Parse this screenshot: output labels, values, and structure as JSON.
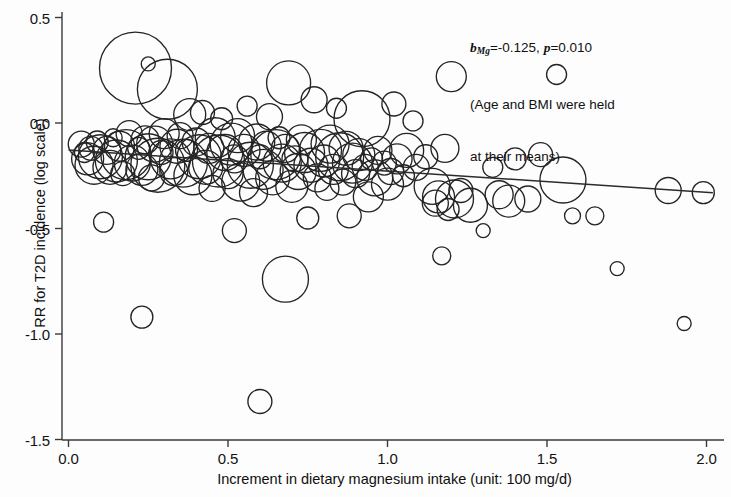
{
  "chart_data": {
    "type": "scatter",
    "title": "",
    "xlabel": "Increment in dietary magnesium intake (unit: 100 mg/d)",
    "ylabel": "RR for T2D incidence (log scale)",
    "xlim": [
      0.0,
      2.05
    ],
    "ylim": [
      -1.55,
      0.55
    ],
    "xticks": [
      "0.0",
      "0.5",
      "1.0",
      "1.5",
      "2.0"
    ],
    "xtick_values": [
      0.0,
      0.5,
      1.0,
      1.5,
      2.0
    ],
    "yticks": [
      "0.5",
      "0.0",
      "-0.5",
      "-1.0",
      "-1.5"
    ],
    "ytick_values": [
      0.5,
      0.0,
      -0.5,
      -1.0,
      -1.5
    ],
    "grid": false,
    "legend": "none",
    "marker_style": "open-circle-variable-size",
    "annotations": {
      "line1_prefix": "b",
      "line1_subscript": "Mg",
      "line1_mid": "=-0.125, ",
      "line1_p": "p",
      "line1_suffix": "=0.010",
      "line2": "(Age and BMI were held",
      "line3": "at their means)",
      "slope": -0.125,
      "p_value": 0.01
    },
    "regression_line": {
      "x_start": 0.0,
      "y_start": -0.128,
      "x_end": 2.02,
      "y_end": -0.33,
      "color": "#2b2b2b"
    },
    "points": [
      {
        "x": 0.04,
        "y": -0.1,
        "s": 13
      },
      {
        "x": 0.05,
        "y": -0.14,
        "s": 10
      },
      {
        "x": 0.06,
        "y": -0.17,
        "s": 16
      },
      {
        "x": 0.07,
        "y": -0.12,
        "s": 12
      },
      {
        "x": 0.08,
        "y": -0.2,
        "s": 19
      },
      {
        "x": 0.09,
        "y": -0.09,
        "s": 11
      },
      {
        "x": 0.1,
        "y": -0.16,
        "s": 22
      },
      {
        "x": 0.11,
        "y": -0.47,
        "s": 10
      },
      {
        "x": 0.12,
        "y": -0.13,
        "s": 14
      },
      {
        "x": 0.13,
        "y": -0.21,
        "s": 17
      },
      {
        "x": 0.14,
        "y": -0.07,
        "s": 9
      },
      {
        "x": 0.15,
        "y": -0.18,
        "s": 21
      },
      {
        "x": 0.16,
        "y": -0.11,
        "s": 15
      },
      {
        "x": 0.17,
        "y": -0.24,
        "s": 12
      },
      {
        "x": 0.18,
        "y": -0.15,
        "s": 25
      },
      {
        "x": 0.19,
        "y": -0.05,
        "s": 13
      },
      {
        "x": 0.2,
        "y": -0.19,
        "s": 18
      },
      {
        "x": 0.21,
        "y": 0.26,
        "s": 36
      },
      {
        "x": 0.22,
        "y": -0.12,
        "s": 11
      },
      {
        "x": 0.23,
        "y": -0.92,
        "s": 11
      },
      {
        "x": 0.23,
        "y": -0.22,
        "s": 16
      },
      {
        "x": 0.24,
        "y": -0.08,
        "s": 14
      },
      {
        "x": 0.25,
        "y": 0.28,
        "s": 7
      },
      {
        "x": 0.25,
        "y": -0.16,
        "s": 23
      },
      {
        "x": 0.26,
        "y": -0.26,
        "s": 13
      },
      {
        "x": 0.27,
        "y": -0.1,
        "s": 18
      },
      {
        "x": 0.28,
        "y": -0.2,
        "s": 27
      },
      {
        "x": 0.29,
        "y": -0.14,
        "s": 12
      },
      {
        "x": 0.3,
        "y": -0.05,
        "s": 15
      },
      {
        "x": 0.31,
        "y": 0.16,
        "s": 30
      },
      {
        "x": 0.32,
        "y": -0.17,
        "s": 20
      },
      {
        "x": 0.33,
        "y": -0.23,
        "s": 14
      },
      {
        "x": 0.34,
        "y": -0.11,
        "s": 17
      },
      {
        "x": 0.35,
        "y": -0.06,
        "s": 13
      },
      {
        "x": 0.36,
        "y": -0.19,
        "s": 24
      },
      {
        "x": 0.37,
        "y": -0.13,
        "s": 11
      },
      {
        "x": 0.38,
        "y": 0.04,
        "s": 16
      },
      {
        "x": 0.39,
        "y": -0.25,
        "s": 19
      },
      {
        "x": 0.4,
        "y": -0.09,
        "s": 14
      },
      {
        "x": 0.41,
        "y": -0.16,
        "s": 22
      },
      {
        "x": 0.42,
        "y": 0.05,
        "s": 12
      },
      {
        "x": 0.43,
        "y": -0.21,
        "s": 17
      },
      {
        "x": 0.44,
        "y": -0.12,
        "s": 15
      },
      {
        "x": 0.45,
        "y": -0.31,
        "s": 13
      },
      {
        "x": 0.46,
        "y": -0.07,
        "s": 20
      },
      {
        "x": 0.47,
        "y": -0.18,
        "s": 26
      },
      {
        "x": 0.48,
        "y": 0.02,
        "s": 11
      },
      {
        "x": 0.49,
        "y": -0.14,
        "s": 18
      },
      {
        "x": 0.5,
        "y": -0.24,
        "s": 15
      },
      {
        "x": 0.51,
        "y": -0.1,
        "s": 21
      },
      {
        "x": 0.52,
        "y": -0.51,
        "s": 12
      },
      {
        "x": 0.52,
        "y": -0.17,
        "s": 14
      },
      {
        "x": 0.53,
        "y": -0.06,
        "s": 17
      },
      {
        "x": 0.54,
        "y": -0.28,
        "s": 19
      },
      {
        "x": 0.55,
        "y": -0.13,
        "s": 16
      },
      {
        "x": 0.56,
        "y": 0.08,
        "s": 10
      },
      {
        "x": 0.57,
        "y": -0.2,
        "s": 23
      },
      {
        "x": 0.58,
        "y": -0.33,
        "s": 14
      },
      {
        "x": 0.59,
        "y": -0.09,
        "s": 18
      },
      {
        "x": 0.6,
        "y": -0.16,
        "s": 12
      },
      {
        "x": 0.6,
        "y": -1.32,
        "s": 12
      },
      {
        "x": 0.61,
        "y": -0.22,
        "s": 20
      },
      {
        "x": 0.62,
        "y": -0.11,
        "s": 15
      },
      {
        "x": 0.63,
        "y": 0.03,
        "s": 13
      },
      {
        "x": 0.64,
        "y": -0.26,
        "s": 17
      },
      {
        "x": 0.65,
        "y": -0.15,
        "s": 25
      },
      {
        "x": 0.66,
        "y": -0.07,
        "s": 11
      },
      {
        "x": 0.67,
        "y": -0.19,
        "s": 19
      },
      {
        "x": 0.68,
        "y": -0.74,
        "s": 23
      },
      {
        "x": 0.68,
        "y": -0.12,
        "s": 14
      },
      {
        "x": 0.69,
        "y": 0.19,
        "s": 22
      },
      {
        "x": 0.7,
        "y": -0.3,
        "s": 16
      },
      {
        "x": 0.71,
        "y": -0.17,
        "s": 13
      },
      {
        "x": 0.72,
        "y": -0.23,
        "s": 18
      },
      {
        "x": 0.73,
        "y": -0.08,
        "s": 15
      },
      {
        "x": 0.74,
        "y": -0.14,
        "s": 20
      },
      {
        "x": 0.75,
        "y": -0.45,
        "s": 11
      },
      {
        "x": 0.76,
        "y": -0.2,
        "s": 17
      },
      {
        "x": 0.77,
        "y": 0.11,
        "s": 13
      },
      {
        "x": 0.78,
        "y": -0.26,
        "s": 14
      },
      {
        "x": 0.79,
        "y": -0.13,
        "s": 21
      },
      {
        "x": 0.8,
        "y": -0.18,
        "s": 16
      },
      {
        "x": 0.81,
        "y": -0.31,
        "s": 12
      },
      {
        "x": 0.82,
        "y": -0.1,
        "s": 19
      },
      {
        "x": 0.83,
        "y": -0.22,
        "s": 15
      },
      {
        "x": 0.84,
        "y": 0.07,
        "s": 10
      },
      {
        "x": 0.85,
        "y": -0.16,
        "s": 24
      },
      {
        "x": 0.86,
        "y": -0.28,
        "s": 13
      },
      {
        "x": 0.87,
        "y": -0.12,
        "s": 17
      },
      {
        "x": 0.88,
        "y": -0.44,
        "s": 12
      },
      {
        "x": 0.89,
        "y": -0.19,
        "s": 20
      },
      {
        "x": 0.9,
        "y": -0.24,
        "s": 14
      },
      {
        "x": 0.91,
        "y": -0.15,
        "s": 16
      },
      {
        "x": 0.92,
        "y": 0.02,
        "s": 28
      },
      {
        "x": 0.93,
        "y": -0.21,
        "s": 13
      },
      {
        "x": 0.94,
        "y": -0.35,
        "s": 15
      },
      {
        "x": 0.95,
        "y": -0.17,
        "s": 11
      },
      {
        "x": 0.96,
        "y": -0.26,
        "s": 18
      },
      {
        "x": 0.97,
        "y": -0.13,
        "s": 14
      },
      {
        "x": 0.99,
        "y": -0.19,
        "s": 12
      },
      {
        "x": 1.0,
        "y": -0.29,
        "s": 16
      },
      {
        "x": 1.01,
        "y": -0.23,
        "s": 13
      },
      {
        "x": 1.02,
        "y": 0.09,
        "s": 12
      },
      {
        "x": 1.03,
        "y": -0.17,
        "s": 15
      },
      {
        "x": 1.05,
        "y": -0.25,
        "s": 11
      },
      {
        "x": 1.06,
        "y": -0.13,
        "s": 17
      },
      {
        "x": 1.08,
        "y": 0.01,
        "s": 10
      },
      {
        "x": 1.09,
        "y": -0.21,
        "s": 13
      },
      {
        "x": 1.12,
        "y": -0.16,
        "s": 12
      },
      {
        "x": 1.14,
        "y": -0.3,
        "s": 18
      },
      {
        "x": 1.15,
        "y": -0.38,
        "s": 13
      },
      {
        "x": 1.16,
        "y": -0.35,
        "s": 16
      },
      {
        "x": 1.17,
        "y": -0.63,
        "s": 9
      },
      {
        "x": 1.18,
        "y": -0.12,
        "s": 14
      },
      {
        "x": 1.19,
        "y": -0.41,
        "s": 11
      },
      {
        "x": 1.2,
        "y": 0.22,
        "s": 15
      },
      {
        "x": 1.21,
        "y": -0.36,
        "s": 19
      },
      {
        "x": 1.23,
        "y": -0.32,
        "s": 12
      },
      {
        "x": 1.26,
        "y": -0.39,
        "s": 17
      },
      {
        "x": 1.3,
        "y": -0.51,
        "s": 7
      },
      {
        "x": 1.33,
        "y": -0.21,
        "s": 10
      },
      {
        "x": 1.35,
        "y": -0.34,
        "s": 14
      },
      {
        "x": 1.38,
        "y": -0.37,
        "s": 16
      },
      {
        "x": 1.4,
        "y": -0.17,
        "s": 11
      },
      {
        "x": 1.44,
        "y": -0.36,
        "s": 13
      },
      {
        "x": 1.48,
        "y": -0.15,
        "s": 12
      },
      {
        "x": 1.53,
        "y": 0.23,
        "s": 10
      },
      {
        "x": 1.55,
        "y": -0.27,
        "s": 23
      },
      {
        "x": 1.58,
        "y": -0.44,
        "s": 8
      },
      {
        "x": 1.65,
        "y": -0.44,
        "s": 9
      },
      {
        "x": 1.72,
        "y": -0.69,
        "s": 7
      },
      {
        "x": 1.88,
        "y": -0.32,
        "s": 13
      },
      {
        "x": 1.93,
        "y": -0.95,
        "s": 7
      },
      {
        "x": 1.99,
        "y": -0.33,
        "s": 11
      }
    ]
  },
  "axes": {
    "x_title": "Increment in dietary magnesium intake (unit: 100 mg/d)",
    "y_title": "RR for T2D incidence (log scale)"
  }
}
